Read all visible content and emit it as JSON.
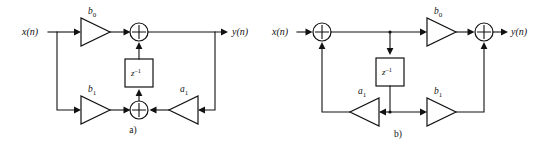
{
  "figure": {
    "diagrams": [
      {
        "id": "a",
        "caption": "a)",
        "form": "direct-form-I",
        "input_label": "x(n)",
        "output_label": "y(n)",
        "delay_label": "z",
        "delay_exponent": "–1",
        "gains": [
          {
            "name": "b0",
            "label": "b",
            "subscript": "0",
            "direction": "right",
            "row": "top"
          },
          {
            "name": "b1",
            "label": "b",
            "subscript": "1",
            "direction": "right",
            "row": "bottom"
          },
          {
            "name": "a1",
            "label": "a",
            "subscript": "1",
            "direction": "left",
            "row": "bottom"
          }
        ],
        "adders": [
          {
            "name": "top-adder",
            "symbol": "plus"
          },
          {
            "name": "bottom-adder",
            "symbol": "plus"
          }
        ]
      },
      {
        "id": "b",
        "caption": "b)",
        "form": "direct-form-II",
        "input_label": "x(n)",
        "output_label": "y(n)",
        "delay_label": "z",
        "delay_exponent": "–1",
        "gains": [
          {
            "name": "b0",
            "label": "b",
            "subscript": "0",
            "direction": "right",
            "row": "top"
          },
          {
            "name": "a1",
            "label": "a",
            "subscript": "1",
            "direction": "left",
            "row": "bottom"
          },
          {
            "name": "b1",
            "label": "b",
            "subscript": "1",
            "direction": "right",
            "row": "bottom"
          }
        ],
        "adders": [
          {
            "name": "input-adder",
            "symbol": "plus"
          },
          {
            "name": "output-adder",
            "symbol": "plus"
          }
        ]
      }
    ],
    "colors": {
      "line": "#111111",
      "background": "#ffffff",
      "fill": "#ffffff"
    }
  }
}
